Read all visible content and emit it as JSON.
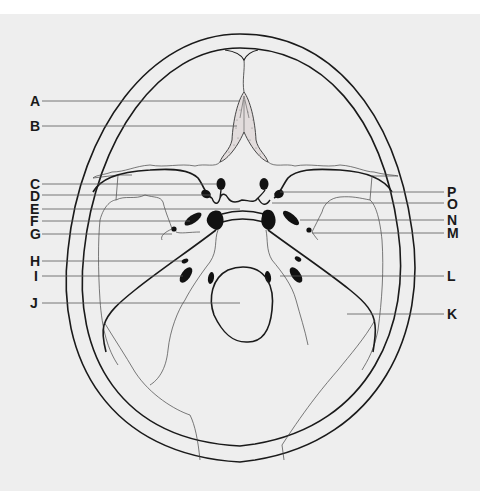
{
  "figure": {
    "background_color": "#eeeeee",
    "line_color": "#1a1a1a",
    "labels_left": [
      {
        "id": "A",
        "text": "A",
        "y": 101
      },
      {
        "id": "B",
        "text": "B",
        "y": 126
      },
      {
        "id": "C",
        "text": "C",
        "y": 184
      },
      {
        "id": "D",
        "text": "D",
        "y": 195
      },
      {
        "id": "E",
        "text": "E",
        "y": 209
      },
      {
        "id": "F",
        "text": "F",
        "y": 221
      },
      {
        "id": "G",
        "text": "G",
        "y": 234
      },
      {
        "id": "H",
        "text": "H",
        "y": 261
      },
      {
        "id": "I",
        "text": "I",
        "y": 276
      },
      {
        "id": "J",
        "text": "J",
        "y": 303
      }
    ],
    "labels_right": [
      {
        "id": "P",
        "text": "P",
        "y": 192
      },
      {
        "id": "O",
        "text": "O",
        "y": 203
      },
      {
        "id": "N",
        "text": "N",
        "y": 220
      },
      {
        "id": "M",
        "text": "M",
        "y": 233
      },
      {
        "id": "L",
        "text": "L",
        "y": 276
      },
      {
        "id": "K",
        "text": "K",
        "y": 314
      }
    ]
  }
}
